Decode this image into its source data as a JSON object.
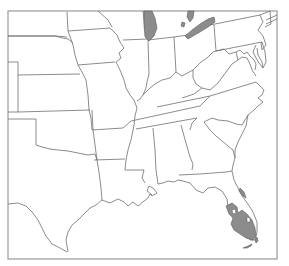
{
  "map": {
    "region": "Central and Southeastern United States",
    "style": "state outline map",
    "colors": {
      "background": "#ffffff",
      "outline": "#6e6e6e",
      "frame": "#9a9a9a",
      "shaded_area": "#8c8c8c"
    },
    "shaded_regions": [
      {
        "id": "lake-michigan",
        "label": "Lake Michigan (shaded)"
      },
      {
        "id": "lake-erie",
        "label": "Lake Erie (shaded)"
      },
      {
        "id": "lake-huron-fragment",
        "label": "Lake Huron fragment (shaded)"
      },
      {
        "id": "south-florida",
        "label": "South Florida range (shaded)"
      },
      {
        "id": "florida-east-coast",
        "label": "Florida east coast strip (shaded)"
      },
      {
        "id": "florida-keys",
        "label": "Florida Keys (shaded)"
      }
    ]
  }
}
